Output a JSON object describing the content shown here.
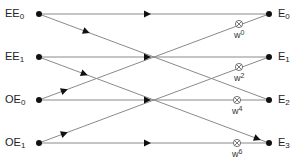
{
  "diagram": {
    "type": "butterfly",
    "inputs": [
      {
        "base": "EE",
        "sub": "0"
      },
      {
        "base": "EE",
        "sub": "1"
      },
      {
        "base": "OE",
        "sub": "0"
      },
      {
        "base": "OE",
        "sub": "1"
      }
    ],
    "outputs": [
      {
        "base": "E",
        "sub": "0"
      },
      {
        "base": "E",
        "sub": "1"
      },
      {
        "base": "E",
        "sub": "2"
      },
      {
        "base": "E",
        "sub": "3"
      }
    ],
    "twiddles": [
      {
        "base": "w",
        "exp": "0"
      },
      {
        "base": "w",
        "exp": "2"
      },
      {
        "base": "w",
        "exp": "4"
      },
      {
        "base": "w",
        "exp": "6"
      }
    ],
    "edges": [
      {
        "from": "EE0",
        "to": "E0"
      },
      {
        "from": "EE0",
        "to": "E2"
      },
      {
        "from": "EE1",
        "to": "E1"
      },
      {
        "from": "EE1",
        "to": "E3"
      },
      {
        "from": "OE0",
        "to": "E2"
      },
      {
        "from": "OE0",
        "to": "E0"
      },
      {
        "from": "OE1",
        "to": "E3"
      },
      {
        "from": "OE1",
        "to": "E1"
      }
    ],
    "multiplier_symbol": "⊗",
    "line_color": "#8a8a8a",
    "node_color": "#111111"
  }
}
